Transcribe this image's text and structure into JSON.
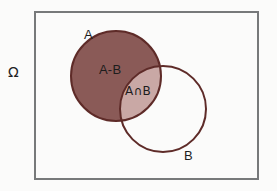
{
  "figure": {
    "type": "venn-diagram",
    "title": "",
    "background_color": "#fbfbfa"
  },
  "universe": {
    "label": "Ω",
    "name": "omega-universal-set",
    "border_color": "#77797a",
    "border_width_px": 2,
    "rect": {
      "x": 34,
      "y": 11,
      "width": 225,
      "height": 169
    },
    "label_position": {
      "x": 8,
      "y": 65
    }
  },
  "sets": [
    {
      "id": "A",
      "label": "A",
      "cx": 116,
      "cy": 76,
      "r": 45,
      "fill": "#8a5a57",
      "stroke": "#5e2b28",
      "stroke_width_px": 2,
      "filled": true,
      "label_position": {
        "x": 84,
        "y": 28
      }
    },
    {
      "id": "B",
      "label": "B",
      "cx": 163,
      "cy": 109,
      "r": 43,
      "fill": "none",
      "stroke": "#5e2b28",
      "stroke_width_px": 2,
      "filled": false,
      "label_position": {
        "x": 184,
        "y": 149
      }
    }
  ],
  "regions": [
    {
      "id": "A-B",
      "label": "A-B",
      "description": "A minus B",
      "fill": "#8a5a57",
      "label_position": {
        "x": 99,
        "y": 63
      }
    },
    {
      "id": "AnB",
      "label": "A∩B",
      "description": "A intersect B",
      "fill": "#c9a8a5",
      "label_position": {
        "x": 125,
        "y": 85
      }
    }
  ],
  "colors": {
    "set_a_fill": "#8a5a57",
    "intersection_fill": "#c9a8a5",
    "circle_stroke": "#5e2b28",
    "rect_stroke": "#77797a",
    "text": "#1d1d1d",
    "canvas": "#fbfbfa"
  },
  "chart_data": {
    "type": "diagram",
    "title": "",
    "categories": [
      "A-B",
      "A∩B",
      "B-A"
    ],
    "values": [
      null,
      null,
      null
    ],
    "xlabel": "",
    "ylabel": ""
  }
}
